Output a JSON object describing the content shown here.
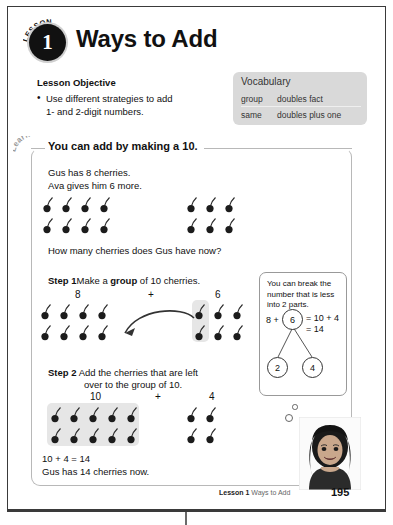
{
  "lesson": {
    "badge_word": "LESSON",
    "badge_number": "1",
    "title": "Ways to Add"
  },
  "objective": {
    "heading": "Lesson Objective",
    "line1": "Use different strategies to add",
    "line2": "1- and 2-digit numbers."
  },
  "vocabulary": {
    "title": "Vocabulary",
    "rows": [
      {
        "left": "group",
        "right": "doubles fact"
      },
      {
        "left": "same",
        "right": "doubles plus one"
      }
    ]
  },
  "learn": {
    "tab_label": "Learn",
    "title": "You can add by making a 10.",
    "story_line1": "Gus has 8 cherries.",
    "story_line2": "Ava gives him 6 more.",
    "question": "How many cherries does Gus have now?",
    "step1_label": "Step 1",
    "step1_text_a": "Make a ",
    "step1_text_bold": "group",
    "step1_text_b": " of 10 cherries.",
    "step1_left_count": "8",
    "step1_plus": "+",
    "step1_right_count": "6",
    "step2_label": "Step 2",
    "step2_line1": "Add the cherries that are left",
    "step2_line2": "over to the group of 10.",
    "step2_left_count": "10",
    "step2_plus": "+",
    "step2_right_count": "4",
    "answer_line1": "10 + 4 = 14",
    "answer_line2": "Gus has 14 cherries now."
  },
  "callout": {
    "line1": "You can break the",
    "line2": "number that is less",
    "line3": "into 2 parts.",
    "eq_left": "8 +",
    "eq_right_line1": "= 10 + 4",
    "eq_right_line2": "= 14",
    "bond_top": "6",
    "bond_left": "2",
    "bond_right": "4"
  },
  "footer": {
    "lesson_label": "Lesson 1",
    "lesson_title": "Ways to Add",
    "page_number": "195"
  },
  "colors": {
    "badge": "#111111",
    "vocab_bg": "#d9d9d9",
    "shade": "#e6e6e6",
    "box_border": "#b8b8b8"
  },
  "chart_data": {
    "type": "table",
    "groups": [
      {
        "name": "gus_cherries",
        "label": "8",
        "rows": 2,
        "cols": 4,
        "count": 8
      },
      {
        "name": "ava_cherries",
        "label": "6",
        "rows": 2,
        "cols": 3,
        "count": 6
      },
      {
        "name": "step2_group_of_ten",
        "label": "10",
        "rows": 2,
        "cols": 5,
        "count": 10
      },
      {
        "name": "step2_leftover",
        "label": "4",
        "rows": 2,
        "cols": 2,
        "count": 4
      }
    ]
  }
}
